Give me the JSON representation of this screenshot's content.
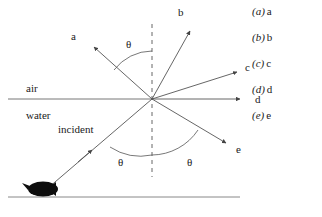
{
  "figure": {
    "media": {
      "upper_label": "air",
      "lower_label": "water"
    },
    "incident_label": "incident",
    "angle_symbol": "θ",
    "angles": [
      {
        "name": "reflection-angle-upper",
        "symbol": "θ"
      },
      {
        "name": "incidence-angle-lower-left",
        "symbol": "θ"
      },
      {
        "name": "angle-lower-right",
        "symbol": "θ"
      }
    ],
    "rays": [
      {
        "id": "a",
        "label": "a",
        "direction": "up-left"
      },
      {
        "id": "b",
        "label": "b",
        "direction": "up-right-steep"
      },
      {
        "id": "c",
        "label": "c",
        "direction": "up-right-shallow"
      },
      {
        "id": "d",
        "label": "d",
        "direction": "horizontal-right"
      },
      {
        "id": "e",
        "label": "e",
        "direction": "down-right"
      }
    ],
    "objects": [
      {
        "name": "fish",
        "description": "black fish silhouette at bottom of water"
      },
      {
        "name": "normal-line",
        "description": "vertical dashed normal at interface"
      },
      {
        "name": "interface-line",
        "description": "horizontal air-water boundary"
      },
      {
        "name": "bottom-line",
        "description": "horizontal pond bottom"
      }
    ],
    "colors": {
      "ink": "#1a1a1a",
      "line": "#555555",
      "background": "#ffffff"
    }
  },
  "options": [
    {
      "key": "(a)",
      "value": "a"
    },
    {
      "key": "(b)",
      "value": "b"
    },
    {
      "key": "(c)",
      "value": "c"
    },
    {
      "key": "(d)",
      "value": "d"
    },
    {
      "key": "(e)",
      "value": "e"
    }
  ]
}
